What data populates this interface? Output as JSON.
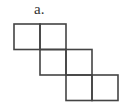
{
  "figure": {
    "label": "a.",
    "stroke_color": "#444444",
    "cell_size": 26,
    "cells": [
      {
        "row": 0,
        "col": 0
      },
      {
        "row": 0,
        "col": 1
      },
      {
        "row": 1,
        "col": 1
      },
      {
        "row": 1,
        "col": 2
      },
      {
        "row": 2,
        "col": 2
      },
      {
        "row": 2,
        "col": 3
      }
    ]
  }
}
